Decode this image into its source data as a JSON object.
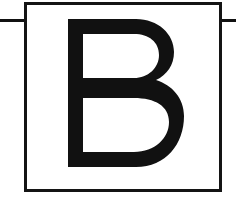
{
  "document": {
    "type": "letterform-specimen-card",
    "title": "B",
    "description": "Capital letter B specimen inside a rectangular frame with a horizontal guide rule"
  },
  "canvas": {
    "width": 236,
    "height": 199,
    "background_color": "#ffffff"
  },
  "guide_rule": {
    "name": "cap-height-rule",
    "orientation": "horizontal",
    "y": 19,
    "x_start": 0,
    "x_end": 236,
    "thickness": 3,
    "color": "#111111",
    "visible_segments": "left of card and right of card"
  },
  "card": {
    "x": 24,
    "y": 2,
    "width": 198,
    "height": 190,
    "border_width": 3,
    "border_color": "#141414",
    "fill_color": "#ffffff"
  },
  "glyph": {
    "character": "B",
    "style": "heavy geometric sans-serif, rounded bowls",
    "color": "#111111",
    "left": 68,
    "right": 178,
    "top": 19,
    "bottom": 167,
    "stem_width": 14,
    "midbar_y": 85,
    "midbar_height": 12,
    "upper_bowl_right": 162,
    "lower_bowl_right": 178
  }
}
